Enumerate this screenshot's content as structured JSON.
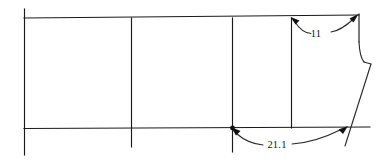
{
  "drawing": {
    "title": "Sectional outline with dimension callouts",
    "background_color": "#ffffff",
    "line_color": "#1a1a1a",
    "text_color": "#151515",
    "width": 383,
    "height": 162
  },
  "dimensions": [
    {
      "id": "upper",
      "label": "11",
      "label_x": 316,
      "label_y": 34,
      "from_x": 291,
      "from_y": 18,
      "to_x": 358,
      "to_y": 15,
      "position": "top-right"
    },
    {
      "id": "lower",
      "label": "21.1",
      "label_x": 276,
      "label_y": 145,
      "from_x": 232,
      "from_y": 128,
      "to_x": 347,
      "to_y": 127,
      "position": "bottom-right"
    }
  ],
  "geometry": {
    "top_line": {
      "x1": 24,
      "y1": 18,
      "x2": 359,
      "y2": 15
    },
    "bottom_line": {
      "x1": 24,
      "y1": 128,
      "x2": 370,
      "y2": 127
    },
    "verticals": [
      {
        "id": "v1",
        "x": 24,
        "y1": 9,
        "y2": 155
      },
      {
        "id": "v2",
        "x": 131,
        "y1": 18,
        "y2": 147
      },
      {
        "id": "v3",
        "x": 232,
        "y1": 18,
        "y2": 152
      },
      {
        "id": "v4",
        "x": 291,
        "y1": 18,
        "y2": 128
      }
    ],
    "right_edge": {
      "x": 359,
      "y1": 15,
      "y2": 42
    },
    "fillet": "concave quarter curve from right edge into ledge",
    "ledge": {
      "x1": 363,
      "y1": 62,
      "x2": 371,
      "y2": 64
    },
    "slant": {
      "x1": 371,
      "y1": 64,
      "x2": 345,
      "y2": 146
    }
  }
}
